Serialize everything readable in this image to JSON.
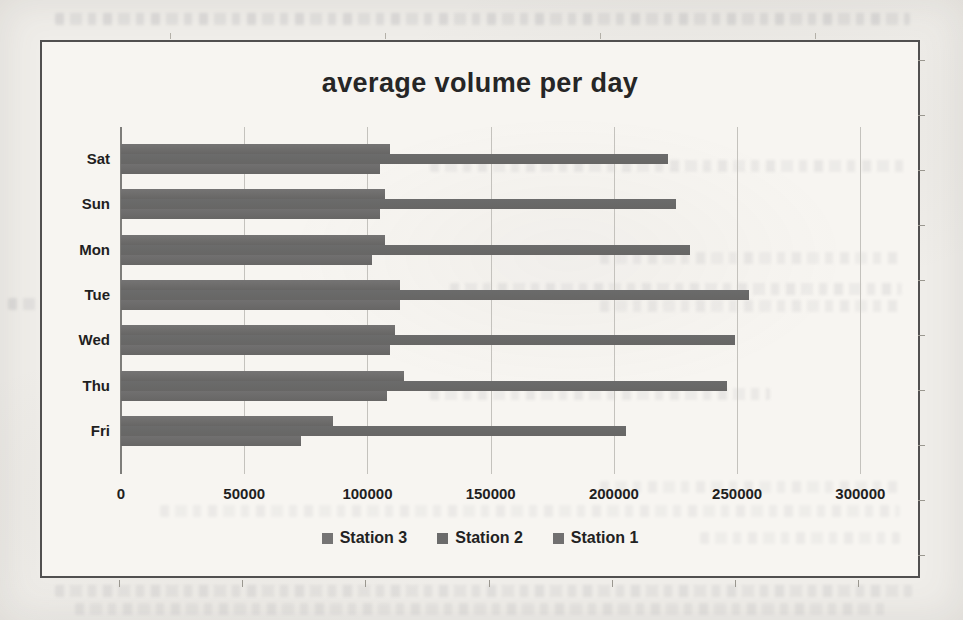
{
  "chart_data": {
    "type": "bar",
    "orientation": "horizontal",
    "title": "average volume per day",
    "categories": [
      "Sat",
      "Sun",
      "Mon",
      "Tue",
      "Wed",
      "Thu",
      "Fri"
    ],
    "series": [
      {
        "name": "Station 3",
        "values": [
          109000,
          107000,
          107000,
          113000,
          111000,
          115000,
          86000
        ]
      },
      {
        "name": "Station 2",
        "values": [
          222000,
          225000,
          231000,
          255000,
          249000,
          246000,
          205000
        ]
      },
      {
        "name": "Station 1",
        "values": [
          105000,
          105000,
          102000,
          113000,
          109000,
          108000,
          73000
        ]
      }
    ],
    "xlabel": "",
    "ylabel": "",
    "xlim": [
      0,
      325000
    ],
    "x_ticks": [
      0,
      50000,
      100000,
      150000,
      200000,
      250000,
      300000
    ],
    "x_tick_labels": [
      "0",
      "50000",
      "100000",
      "150000",
      "200000",
      "250000",
      "300000"
    ],
    "grid": "vertical",
    "legend": [
      "Station 3",
      "Station 2",
      "Station 1"
    ],
    "legend_position": "bottom"
  },
  "colors": {
    "series": [
      "#757474",
      "#6b6b6b",
      "#717070"
    ],
    "gridline": "#c4c2bd",
    "axis_line": "#7e7d7a",
    "chart_border": "#3e3e3e",
    "chart_bg": "#f7f5f1",
    "page_bg": "#efede9",
    "text": "#212121"
  }
}
